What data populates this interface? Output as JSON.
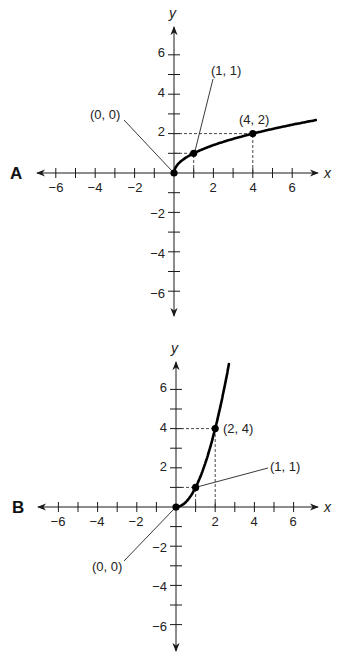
{
  "graphs": [
    {
      "id": "A",
      "label": "A",
      "function": "y = sqrt(x)",
      "x_axis_label": "x",
      "y_axis_label": "y",
      "x_tick_labels": [
        "−6",
        "−4",
        "−2",
        "2",
        "4",
        "6"
      ],
      "y_tick_labels": [
        "6",
        "4",
        "2",
        "−2",
        "−4",
        "−6"
      ],
      "points": [
        {
          "label": "(0, 0)",
          "x": 0,
          "y": 0
        },
        {
          "label": "(1, 1)",
          "x": 1,
          "y": 1
        },
        {
          "label": "(4, 2)",
          "x": 4,
          "y": 2
        }
      ],
      "layout": {
        "ox": 174,
        "oy": 173,
        "unit": 19.7
      }
    },
    {
      "id": "B",
      "label": "B",
      "function": "y = x^2 (x >= 0)",
      "x_axis_label": "x",
      "y_axis_label": "y",
      "x_tick_labels": [
        "−6",
        "−4",
        "−2",
        "2",
        "4",
        "6"
      ],
      "y_tick_labels": [
        "6",
        "4",
        "2",
        "−2",
        "−4",
        "−6"
      ],
      "points": [
        {
          "label": "(0, 0)",
          "x": 0,
          "y": 0
        },
        {
          "label": "(1, 1)",
          "x": 1,
          "y": 1
        },
        {
          "label": "(2, 4)",
          "x": 2,
          "y": 4
        }
      ],
      "layout": {
        "ox": 176,
        "oy": 507,
        "unit": 19.6
      }
    }
  ],
  "chart_data": [
    {
      "type": "line",
      "title": "A",
      "xlabel": "x",
      "ylabel": "y",
      "xlim": [
        -7,
        7
      ],
      "ylim": [
        -7,
        7
      ],
      "grid": false,
      "x_ticks": [
        -6,
        -5,
        -4,
        -3,
        -2,
        -1,
        1,
        2,
        3,
        4,
        5,
        6
      ],
      "x_tick_labels": [
        -6,
        -4,
        -2,
        2,
        4,
        6
      ],
      "y_ticks": [
        -6,
        -5,
        -4,
        -3,
        -2,
        -1,
        1,
        2,
        3,
        4,
        5,
        6
      ],
      "y_tick_labels": [
        -6,
        -4,
        -2,
        2,
        4,
        6
      ],
      "series": [
        {
          "name": "y = √x",
          "x": [
            0,
            0.25,
            1,
            2,
            4,
            6,
            7.2
          ],
          "y": [
            0,
            0.5,
            1,
            1.41,
            2,
            2.45,
            2.68
          ]
        }
      ],
      "annotations": [
        "(0, 0)",
        "(1, 1)",
        "(4, 2)"
      ],
      "dashed_guides": [
        {
          "from": [
            0,
            2
          ],
          "to": [
            4,
            2
          ]
        },
        {
          "from": [
            4,
            0
          ],
          "to": [
            4,
            2
          ]
        },
        {
          "from": [
            0,
            1
          ],
          "to": [
            1,
            1
          ]
        },
        {
          "from": [
            1,
            0
          ],
          "to": [
            1,
            1
          ]
        }
      ]
    },
    {
      "type": "line",
      "title": "B",
      "xlabel": "x",
      "ylabel": "y",
      "xlim": [
        -7,
        7
      ],
      "ylim": [
        -7,
        7
      ],
      "grid": false,
      "x_ticks": [
        -6,
        -5,
        -4,
        -3,
        -2,
        -1,
        1,
        2,
        3,
        4,
        5,
        6
      ],
      "x_tick_labels": [
        -6,
        -4,
        -2,
        2,
        4,
        6
      ],
      "y_ticks": [
        -6,
        -5,
        -4,
        -3,
        -2,
        -1,
        1,
        2,
        3,
        4,
        5,
        6
      ],
      "y_tick_labels": [
        -6,
        -4,
        -2,
        2,
        4,
        6
      ],
      "series": [
        {
          "name": "y = x²",
          "x": [
            0,
            0.5,
            1,
            1.5,
            2,
            2.5,
            2.7
          ],
          "y": [
            0,
            0.25,
            1,
            2.25,
            4,
            6.25,
            7.29
          ]
        }
      ],
      "annotations": [
        "(0, 0)",
        "(1, 1)",
        "(2, 4)"
      ],
      "dashed_guides": [
        {
          "from": [
            0,
            4
          ],
          "to": [
            2,
            4
          ]
        },
        {
          "from": [
            2,
            0
          ],
          "to": [
            2,
            4
          ]
        },
        {
          "from": [
            0,
            1
          ],
          "to": [
            1,
            1
          ]
        },
        {
          "from": [
            1,
            0
          ],
          "to": [
            1,
            1
          ]
        }
      ]
    }
  ]
}
